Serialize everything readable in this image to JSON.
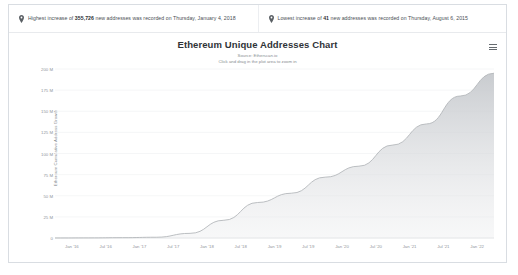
{
  "banners": [
    {
      "icon": "map-pin-icon",
      "prefix": "Highest increase of ",
      "value": "355,726",
      "suffix": " new addresses was recorded on Thursday, January 4, 2018"
    },
    {
      "icon": "map-pin-icon",
      "prefix": "Lowest increase of ",
      "value": "41",
      "suffix": " new addresses was recorded on Thursday, August 6, 2015"
    }
  ],
  "chart": {
    "menu_icon": "hamburger-menu-icon",
    "title": "Ethereum Unique Addresses Chart",
    "source": "Source: Etherscan.io",
    "hint": "Click and drag in the plot area to zoom in"
  },
  "chart_data": {
    "type": "area",
    "title": "Ethereum Unique Addresses Chart",
    "subtitle": "Source: Etherscan.io",
    "annotation": "Click and drag in the plot area to zoom in",
    "xlabel": "",
    "ylabel": "Ethereum Cumulative Address Growth",
    "ylim": [
      0,
      200000000
    ],
    "grid": true,
    "legend": false,
    "legend_position": "none",
    "line_color": "#b9bcc0",
    "fill_color": "#c9ccd0",
    "ytick_labels": [
      "0",
      "25 M",
      "50 M",
      "75 M",
      "100 M",
      "125 M",
      "150 M",
      "175 M",
      "200 M"
    ],
    "ytick_values": [
      0,
      25000000,
      50000000,
      75000000,
      100000000,
      125000000,
      150000000,
      175000000,
      200000000
    ],
    "xtick_labels": [
      "Jan '16",
      "Jul '16",
      "Jan '17",
      "Jul '17",
      "Jan '18",
      "Jul '18",
      "Jan '19",
      "Jul '19",
      "Jan '20",
      "Jul '20",
      "Jan '21",
      "Jul '21",
      "Jan '22"
    ],
    "x": [
      "2015-08",
      "2016-01",
      "2016-07",
      "2017-01",
      "2017-07",
      "2018-01",
      "2018-07",
      "2019-01",
      "2019-07",
      "2020-01",
      "2020-07",
      "2021-01",
      "2021-07",
      "2022-01"
    ],
    "series": [
      {
        "name": "Cumulative unique addresses",
        "values": [
          20000,
          120000,
          400000,
          900000,
          5500000,
          21000000,
          42000000,
          53000000,
          72000000,
          85000000,
          110000000,
          135000000,
          168000000,
          195000000
        ]
      }
    ],
    "highest_increase": {
      "value": 355726,
      "date": "Thursday, January 4, 2018"
    },
    "lowest_increase": {
      "value": 41,
      "date": "Thursday, August 6, 2015"
    }
  }
}
